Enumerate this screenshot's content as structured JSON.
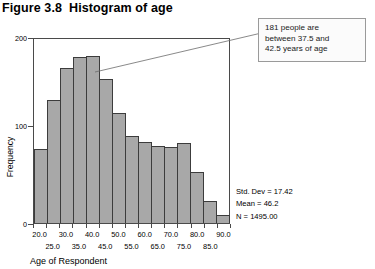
{
  "figure": {
    "number": "Figure 3.8",
    "title": "Histogram of age"
  },
  "callout": {
    "line1": "181 people are",
    "line2": "between 37.5 and",
    "line3": "42.5 years of age"
  },
  "stats": {
    "std_dev": "Std. Dev = 17.42",
    "mean": "Mean = 46.2",
    "n": "N = 1495.00"
  },
  "axes": {
    "y_label": "Frequency",
    "x_label": "Age of Respondent",
    "y_ticks": [
      "0",
      "100",
      "200"
    ],
    "x_labels_top": [
      "20.0",
      "30.0",
      "40.0",
      "50.0",
      "60.0",
      "70.0",
      "80.0",
      "90.0"
    ],
    "x_labels_bottom": [
      "25.0",
      "35.0",
      "45.0",
      "55.0",
      "65.0",
      "75.0",
      "85.0"
    ]
  },
  "chart_data": {
    "type": "bar",
    "title": "Histogram of age",
    "xlabel": "Age of Respondent",
    "ylabel": "Frequency",
    "ylim": [
      0,
      200
    ],
    "xlim": [
      17.5,
      92.5
    ],
    "bin_width": 5,
    "grid": false,
    "legend": false,
    "bin_centers": [
      20.0,
      25.0,
      30.0,
      35.0,
      40.0,
      45.0,
      50.0,
      55.0,
      60.0,
      65.0,
      70.0,
      75.0,
      80.0,
      85.0,
      90.0
    ],
    "categories": [
      "20.0",
      "25.0",
      "30.0",
      "35.0",
      "40.0",
      "45.0",
      "50.0",
      "55.0",
      "60.0",
      "65.0",
      "70.0",
      "75.0",
      "80.0",
      "85.0",
      "90.0"
    ],
    "values": [
      80,
      134,
      168,
      180,
      181,
      157,
      120,
      95,
      88,
      84,
      83,
      87,
      55,
      24,
      9
    ],
    "annotations": [
      {
        "text": "181 people are between 37.5 and 42.5 years of age",
        "bin_center": 40.0,
        "value": 181
      }
    ],
    "summary_stats": {
      "std_dev": 17.42,
      "mean": 46.2,
      "n": 1495.0
    }
  },
  "colors": {
    "bar_fill": "#a8a8a8",
    "bar_edge": "#3c3c3c",
    "frame": "#4a4a4a",
    "callout_border": "#9a9a9a"
  }
}
